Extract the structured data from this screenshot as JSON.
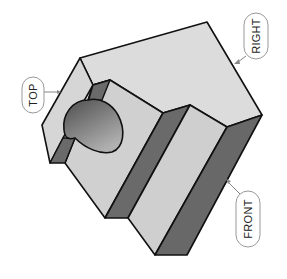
{
  "figure": {
    "type": "isometric-block-drawing",
    "labels": {
      "top": "TOP",
      "right": "RIGHT",
      "front": "FRONT"
    },
    "colors": {
      "background": "#ffffff",
      "light_face": "#d4d4d4",
      "top_face": "#dedede",
      "dark_face": "#6b6b6b",
      "hole_dark": "#5a5a5a",
      "hole_light": "#a8a8a8",
      "outline": "#111111",
      "leader": "#888888",
      "label_border": "#999999"
    }
  }
}
